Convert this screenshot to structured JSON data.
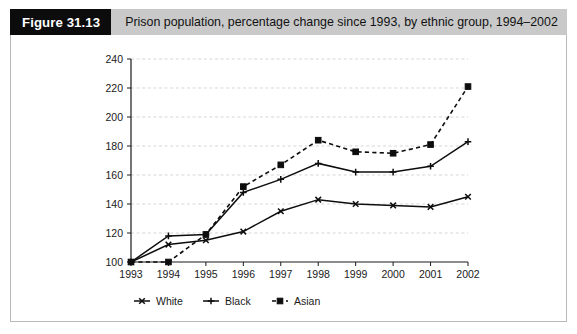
{
  "header": {
    "figure_number": "Figure 31.13",
    "caption": "Prison population, percentage change since 1993, by ethnic group, 1994–2002"
  },
  "chart_data": {
    "type": "line",
    "title": "Prison population, percentage change since 1993, by ethnic group, 1994–2002",
    "xlabel": "",
    "ylabel": "",
    "x": [
      "1993",
      "1994",
      "1995",
      "1996",
      "1997",
      "1998",
      "1999",
      "2000",
      "2001",
      "2002"
    ],
    "categories": [
      "1993",
      "1994",
      "1995",
      "1996",
      "1997",
      "1998",
      "1999",
      "2000",
      "2001",
      "2002"
    ],
    "xlim": [
      1993,
      2002
    ],
    "ylim": [
      100,
      240
    ],
    "yticks": [
      100,
      120,
      140,
      160,
      180,
      200,
      220,
      240
    ],
    "xticks": [
      "1993",
      "1994",
      "1995",
      "1996",
      "1997",
      "1998",
      "1999",
      "2000",
      "2001",
      "2002"
    ],
    "grid": true,
    "legend_position": "bottom",
    "series": [
      {
        "name": "White",
        "marker": "cross",
        "linestyle": "solid",
        "color": "#0d0d0d",
        "values": [
          100,
          112,
          115,
          121,
          135,
          143,
          140,
          139,
          138,
          145
        ]
      },
      {
        "name": "Black",
        "marker": "plus",
        "linestyle": "solid",
        "color": "#0d0d0d",
        "values": [
          100,
          118,
          119,
          148,
          157,
          168,
          162,
          162,
          166,
          183
        ]
      },
      {
        "name": "Asian",
        "marker": "square",
        "linestyle": "dashed",
        "color": "#0d0d0d",
        "values": [
          100,
          100,
          119,
          152,
          167,
          184,
          176,
          175,
          181,
          221
        ]
      }
    ]
  },
  "legend": {
    "items": [
      {
        "label": "White",
        "marker": "cross-marker",
        "linestyle": "solid"
      },
      {
        "label": "Black",
        "marker": "plus-marker",
        "linestyle": "solid"
      },
      {
        "label": "Asian",
        "marker": "square-marker",
        "linestyle": "dashed"
      }
    ]
  }
}
